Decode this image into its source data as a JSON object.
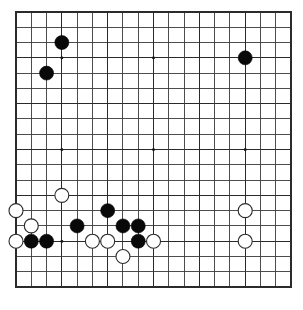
{
  "app": {
    "title": "Go Board Diagram",
    "description": "19x19 Go board position"
  },
  "board": {
    "name": "go-board",
    "size": 19,
    "origin_x": 16,
    "origin_y": 12,
    "cell": 15.28,
    "stone_radius": 7.0,
    "star_radius": 1.5,
    "line_color": "#3a3a3a",
    "border_color": "#2b2b2b",
    "background_color": "#ffffff",
    "black_color": "#090909",
    "white_color": "#ffffff",
    "white_outline_color": "#2a2a2a",
    "star_points": [
      {
        "col": 4,
        "row": 4
      },
      {
        "col": 10,
        "row": 4
      },
      {
        "col": 16,
        "row": 4
      },
      {
        "col": 4,
        "row": 10
      },
      {
        "col": 10,
        "row": 10
      },
      {
        "col": 16,
        "row": 10
      },
      {
        "col": 4,
        "row": 16
      },
      {
        "col": 10,
        "row": 16
      },
      {
        "col": 16,
        "row": 16
      }
    ],
    "stones": [
      {
        "color": "black",
        "col": 4,
        "row": 3
      },
      {
        "color": "black",
        "col": 3,
        "row": 5
      },
      {
        "color": "black",
        "col": 16,
        "row": 4
      },
      {
        "color": "white",
        "col": 4,
        "row": 13
      },
      {
        "color": "white",
        "col": 1,
        "row": 14
      },
      {
        "color": "black",
        "col": 7,
        "row": 14
      },
      {
        "color": "white",
        "col": 16,
        "row": 14
      },
      {
        "color": "white",
        "col": 2,
        "row": 15
      },
      {
        "color": "black",
        "col": 5,
        "row": 15
      },
      {
        "color": "black",
        "col": 8,
        "row": 15
      },
      {
        "color": "black",
        "col": 9,
        "row": 15
      },
      {
        "color": "white",
        "col": 1,
        "row": 16
      },
      {
        "color": "black",
        "col": 2,
        "row": 16
      },
      {
        "color": "black",
        "col": 3,
        "row": 16
      },
      {
        "color": "white",
        "col": 6,
        "row": 16
      },
      {
        "color": "white",
        "col": 7,
        "row": 16
      },
      {
        "color": "black",
        "col": 9,
        "row": 16
      },
      {
        "color": "white",
        "col": 10,
        "row": 16
      },
      {
        "color": "white",
        "col": 16,
        "row": 16
      },
      {
        "color": "white",
        "col": 8,
        "row": 17
      }
    ]
  }
}
